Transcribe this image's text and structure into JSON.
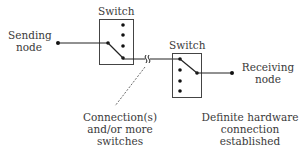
{
  "diagram": {
    "type": "circuit-switching",
    "switch1": {
      "label": "Switch"
    },
    "switch2": {
      "label": "Switch"
    },
    "sending_node": {
      "line1": "Sending",
      "line2": "node"
    },
    "receiving_node": {
      "line1": "Receiving",
      "line2": "node"
    },
    "connection_note": {
      "line1": "Connection(s)",
      "line2": "and/or more",
      "line3": "switches"
    },
    "hardware_note": {
      "line1": "Definite hardware",
      "line2": "connection",
      "line3": "established"
    },
    "colors": {
      "line": "#222222",
      "text": "#3a3a3a",
      "background": "#ffffff"
    }
  }
}
